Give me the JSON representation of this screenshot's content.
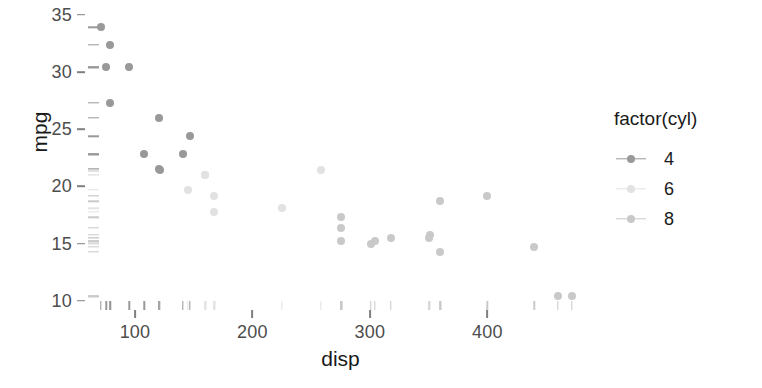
{
  "chart_data": {
    "type": "scatter",
    "title": "",
    "xlabel": "disp",
    "ylabel": "mpg",
    "xlim": [
      60,
      490
    ],
    "ylim": [
      9.2,
      35.6
    ],
    "xticks": [
      100,
      200,
      300,
      400
    ],
    "yticks": [
      10,
      15,
      20,
      25,
      30,
      35
    ],
    "grid": false,
    "legend": {
      "title": "factor(cyl)",
      "position": "right",
      "entries": [
        {
          "label": "4",
          "color": "#999999"
        },
        {
          "label": "6",
          "color": "#e2e2e2"
        },
        {
          "label": "8",
          "color": "#c9c9c9"
        }
      ]
    },
    "rug": true,
    "series": [
      {
        "name": "4",
        "color": "#999999",
        "points": [
          {
            "x": 108.0,
            "y": 22.8
          },
          {
            "x": 146.7,
            "y": 24.4
          },
          {
            "x": 140.8,
            "y": 22.8
          },
          {
            "x": 78.7,
            "y": 32.4
          },
          {
            "x": 75.7,
            "y": 30.4
          },
          {
            "x": 71.1,
            "y": 33.9
          },
          {
            "x": 120.1,
            "y": 21.5
          },
          {
            "x": 79.0,
            "y": 27.3
          },
          {
            "x": 120.3,
            "y": 26.0
          },
          {
            "x": 95.1,
            "y": 30.4
          },
          {
            "x": 121.0,
            "y": 21.4
          }
        ]
      },
      {
        "name": "6",
        "color": "#e2e2e2",
        "points": [
          {
            "x": 160.0,
            "y": 21.0
          },
          {
            "x": 160.0,
            "y": 21.0
          },
          {
            "x": 258.0,
            "y": 21.4
          },
          {
            "x": 225.0,
            "y": 18.1
          },
          {
            "x": 167.6,
            "y": 19.2
          },
          {
            "x": 167.6,
            "y": 17.8
          },
          {
            "x": 145.0,
            "y": 19.7
          }
        ]
      },
      {
        "name": "8",
        "color": "#c9c9c9",
        "points": [
          {
            "x": 360.0,
            "y": 18.7
          },
          {
            "x": 360.0,
            "y": 14.3
          },
          {
            "x": 275.8,
            "y": 16.4
          },
          {
            "x": 275.8,
            "y": 17.3
          },
          {
            "x": 275.8,
            "y": 15.2
          },
          {
            "x": 472.0,
            "y": 10.4
          },
          {
            "x": 460.0,
            "y": 10.4
          },
          {
            "x": 440.0,
            "y": 14.7
          },
          {
            "x": 318.0,
            "y": 15.5
          },
          {
            "x": 304.0,
            "y": 15.2
          },
          {
            "x": 350.0,
            "y": 15.5
          },
          {
            "x": 400.0,
            "y": 19.2
          },
          {
            "x": 351.0,
            "y": 15.8
          },
          {
            "x": 301.0,
            "y": 15.0
          }
        ]
      }
    ]
  }
}
